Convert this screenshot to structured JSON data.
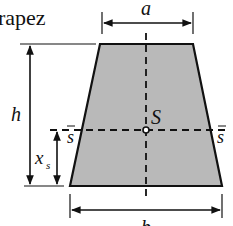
{
  "title": "rapez",
  "labels": {
    "top_width": "a",
    "bottom_width": "b",
    "height": "h",
    "centroid": "S",
    "centroid_height_base": "x",
    "centroid_height_sub": "s",
    "axis_left": "s",
    "axis_right": "s"
  },
  "colors": {
    "fill": "#b9b9b9",
    "stroke": "#111111"
  }
}
